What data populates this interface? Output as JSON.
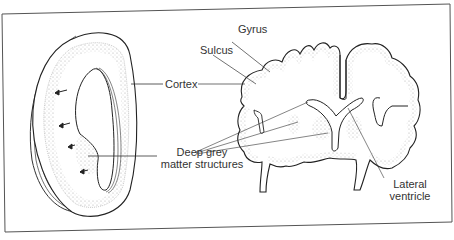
{
  "figure": {
    "left_panel": "Simplified hemisphere shell (cross section)",
    "right_panel": "Coronal section of brain"
  },
  "labels": {
    "gyrus": "Gyrus",
    "sulcus": "Sulcus",
    "cortex": "Cortex",
    "deep_grey_line1": "Deep grey",
    "deep_grey_line2": "matter structures",
    "lateral_line1": "Lateral",
    "lateral_line2": "ventricle"
  },
  "colors": {
    "line": "#2b2b2b",
    "stipple": "#9a9a9a",
    "frame": "#555555",
    "text": "#333333"
  }
}
